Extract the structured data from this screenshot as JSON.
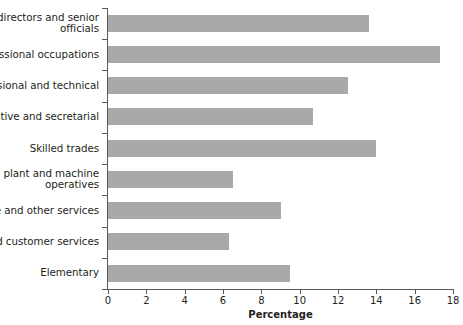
{
  "chart_data": {
    "type": "bar",
    "orientation": "horizontal",
    "title": "",
    "xlabel": "Percentage",
    "ylabel": "",
    "xlim": [
      0,
      18
    ],
    "xticks": [
      0,
      2,
      4,
      6,
      8,
      10,
      12,
      14,
      16,
      18
    ],
    "grid": false,
    "legend": null,
    "bar_color": "#a9a9a9",
    "axis_color": "#58595b",
    "categories": [
      "Managers, directors and senior officials",
      "Professional occupations",
      "Associate professional and technical",
      "Administrative and secretarial",
      "Skilled trades",
      "Process plant and machine operatives",
      "Caring, leisure and other services",
      "Sales and customer services",
      "Elementary"
    ],
    "values": [
      13.6,
      17.3,
      12.5,
      10.7,
      14.0,
      6.5,
      9.0,
      6.3,
      9.5
    ]
  }
}
